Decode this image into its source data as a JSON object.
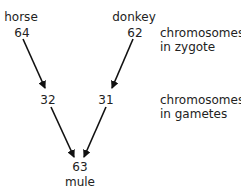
{
  "diagram": {
    "parents": {
      "horse": {
        "label": "horse",
        "zygote": "64",
        "gamete": "32"
      },
      "donkey": {
        "label": "donkey",
        "zygote": "62",
        "gamete": "31"
      }
    },
    "offspring": {
      "label": "mule",
      "zygote": "63"
    },
    "row_labels": {
      "zygote": {
        "line1": "chromosomes",
        "line2": "in zygote"
      },
      "gametes": {
        "line1": "chromosomes",
        "line2": "in gametes"
      }
    },
    "colors": {
      "text": "#222222",
      "arrow": "#111111",
      "background": "#ffffff"
    }
  }
}
